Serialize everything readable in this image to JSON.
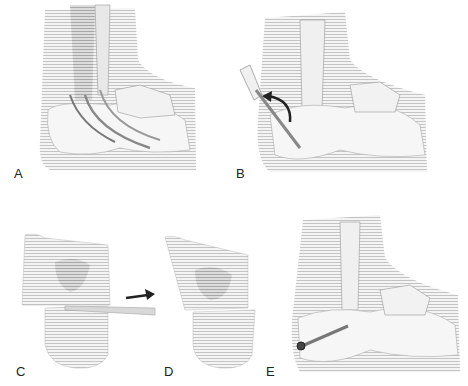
{
  "figure": {
    "panels": [
      {
        "id": "A",
        "label": "A",
        "description": "Lateral ankle/hindfoot with tendon passing behind fibula"
      },
      {
        "id": "B",
        "label": "B",
        "description": "Calcaneal osteotomy with curved arrow showing displacement"
      },
      {
        "id": "C",
        "label": "C",
        "description": "Calcaneus with wedge cut"
      },
      {
        "id": "D",
        "label": "D",
        "description": "Calcaneus after translation of posterior fragment"
      },
      {
        "id": "E",
        "label": "E",
        "description": "Hindfoot with screw fixation of calcaneal osteotomy"
      }
    ],
    "colors": {
      "background": "#ffffff",
      "bone": "#eeeeee",
      "shading": "#c8c8c8",
      "line": "#888888",
      "arrow": "#222222"
    }
  }
}
